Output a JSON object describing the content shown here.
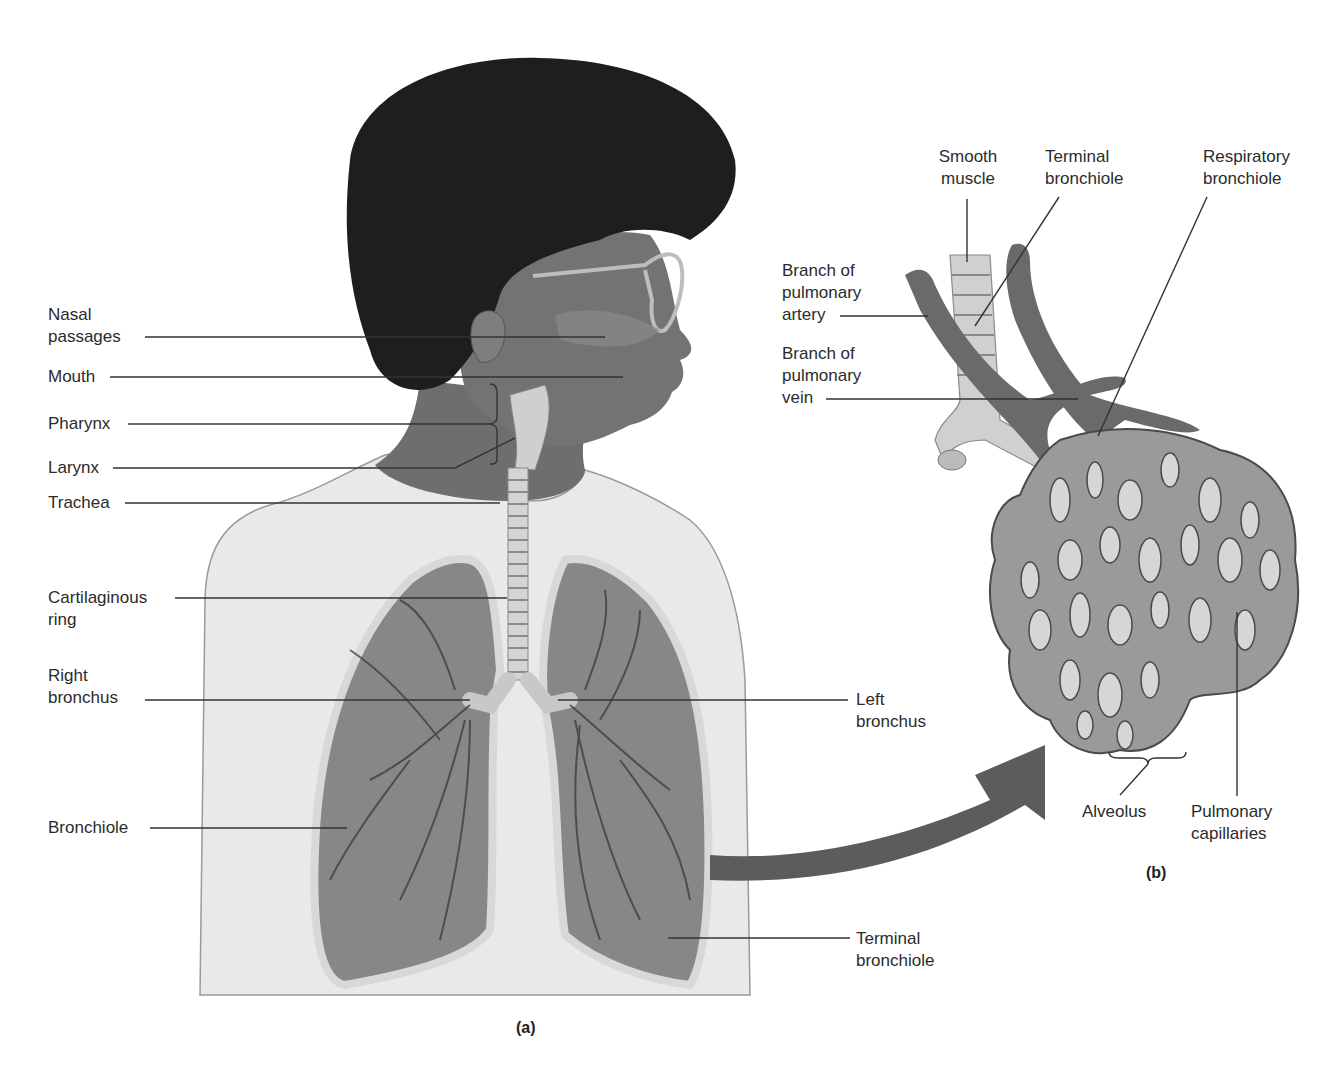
{
  "figure": {
    "panels": [
      {
        "id": "a",
        "label": "(a)"
      },
      {
        "id": "b",
        "label": "(b)"
      }
    ]
  },
  "panel_a": {
    "labels": {
      "nasal_passages": {
        "line1": "Nasal",
        "line2": "passages"
      },
      "mouth": {
        "line1": "Mouth"
      },
      "pharynx": {
        "line1": "Pharynx"
      },
      "larynx": {
        "line1": "Larynx"
      },
      "trachea": {
        "line1": "Trachea"
      },
      "cartilaginous_ring": {
        "line1": "Cartilaginous",
        "line2": "ring"
      },
      "right_bronchus": {
        "line1": "Right",
        "line2": "bronchus"
      },
      "bronchiole": {
        "line1": "Bronchiole"
      },
      "left_bronchus": {
        "line1": "Left",
        "line2": "bronchus"
      },
      "terminal_bronchiole": {
        "line1": "Terminal",
        "line2": "bronchiole"
      }
    }
  },
  "panel_b": {
    "labels": {
      "smooth_muscle": {
        "line1": "Smooth",
        "line2": "muscle"
      },
      "terminal_bronchiole": {
        "line1": "Terminal",
        "line2": "bronchiole"
      },
      "respiratory_bronchiole": {
        "line1": "Respiratory",
        "line2": "bronchiole"
      },
      "pulmonary_artery_branch": {
        "line1": "Branch of",
        "line2": "pulmonary",
        "line3": "artery"
      },
      "pulmonary_vein_branch": {
        "line1": "Branch of",
        "line2": "pulmonary",
        "line3": "vein"
      },
      "alveolus": {
        "line1": "Alveolus"
      },
      "pulmonary_capillaries": {
        "line1": "Pulmonary",
        "line2": "capillaries"
      }
    }
  },
  "colors": {
    "hair": "#1c1c1c",
    "skin": "#7a7a7a",
    "shirt": "#e6e6e6",
    "lung": "#8a8a8a",
    "lung_border": "#d2d2d2",
    "vessel": "#6a6a6a",
    "arrow": "#5a5a5a",
    "leader": "#333333"
  }
}
